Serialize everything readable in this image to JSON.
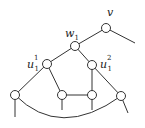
{
  "diagram": {
    "type": "graph",
    "nodes": [
      {
        "id": "v",
        "label": "v"
      },
      {
        "id": "w1",
        "label": "w",
        "sub": "1"
      },
      {
        "id": "u11",
        "label": "u",
        "sub": "1",
        "sup": "1"
      },
      {
        "id": "u12",
        "label": "u",
        "sub": "1",
        "sup": "2"
      },
      {
        "id": "b1",
        "label": ""
      },
      {
        "id": "b2",
        "label": ""
      },
      {
        "id": "b3",
        "label": ""
      },
      {
        "id": "b4",
        "label": ""
      }
    ],
    "edges": [
      [
        "v",
        "w1"
      ],
      [
        "w1",
        "u11"
      ],
      [
        "w1",
        "u12"
      ],
      [
        "u11",
        "b1"
      ],
      [
        "u11",
        "b2"
      ],
      [
        "u12",
        "b3"
      ],
      [
        "u12",
        "b4"
      ],
      [
        "b2",
        "b3"
      ],
      [
        "b1",
        "b4"
      ]
    ],
    "pendant_edges": [
      "v",
      "b1",
      "b2",
      "b3",
      "b4"
    ]
  }
}
